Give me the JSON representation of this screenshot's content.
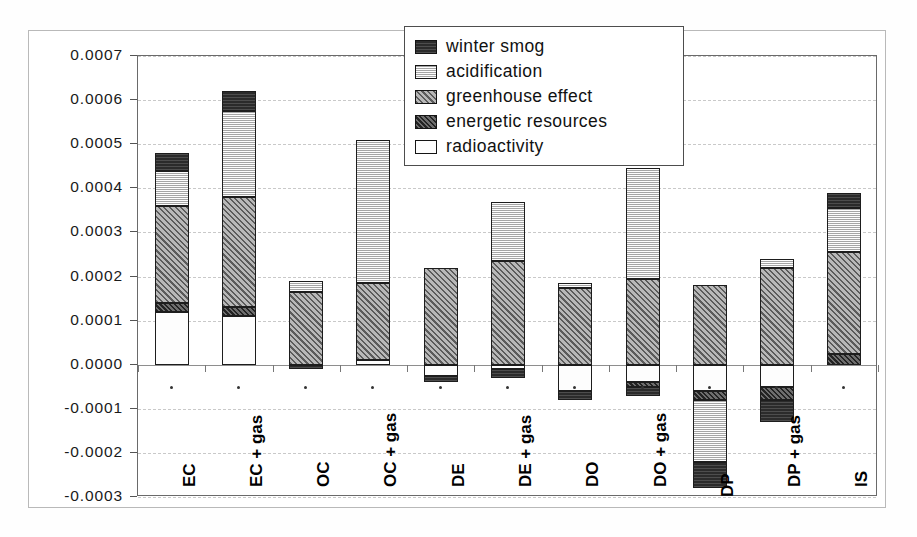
{
  "chart_data": {
    "type": "bar",
    "stacked": true,
    "title": "",
    "xlabel": "",
    "ylabel": "",
    "ylim": [
      -0.0003,
      0.0007
    ],
    "ytick_step": 0.0001,
    "ytick_labels": [
      "0.0007",
      "0.0006",
      "0.0005",
      "0.0004",
      "0.0003",
      "0.0002",
      "0.0001",
      "0.0000",
      "-0.0001",
      "-0.0002",
      "-0.0003"
    ],
    "ytick_values": [
      0.0007,
      0.0006,
      0.0005,
      0.0004,
      0.0003,
      0.0002,
      0.0001,
      0.0,
      -0.0001,
      -0.0002,
      -0.0003
    ],
    "grid": true,
    "legend_position": "top-center-inside",
    "categories": [
      "EC",
      "EC + gas",
      "OC",
      "OC + gas",
      "DE",
      "DE + gas",
      "DO",
      "DO + gas",
      "DP",
      "DP + gas",
      "IS"
    ],
    "series": [
      {
        "name": "winter smog",
        "color": "#2b2b2b",
        "pattern": "dark-solid",
        "values": [
          4e-05,
          4e-05,
          -1e-05,
          0.0,
          -2.5e-05,
          -2e-05,
          -2e-05,
          -1e-05,
          -6e-05,
          -5e-05,
          3e-05
        ]
      },
      {
        "name": "acidification",
        "color": "#dcdcdc",
        "pattern": "light-hatch",
        "values": [
          8e-05,
          0.00024,
          2e-05,
          0.000325,
          0.0,
          0.00013,
          1e-05,
          0.00025,
          -0.00014,
          2e-05,
          0.00011
        ]
      },
      {
        "name": "greenhouse effect",
        "color": "#9a9a9a",
        "pattern": "mid-diagonal",
        "values": [
          0.00022,
          0.00026,
          0.00017,
          0.00018,
          0.00022,
          0.00024,
          0.000175,
          0.000195,
          0.00018,
          0.00022,
          0.00022
        ]
      },
      {
        "name": "energetic resources",
        "color": "#4f4f4f",
        "pattern": "dark-diagonal",
        "values": [
          2e-05,
          2e-05,
          0.0,
          0.0,
          -1e-05,
          -1e-05,
          -2e-05,
          -2e-05,
          -2e-05,
          -3e-05,
          3e-05
        ]
      },
      {
        "name": "radioactivity",
        "color": "#fdfdfd",
        "pattern": "dotted",
        "values": [
          0.00012,
          0.00011,
          0.0,
          1e-05,
          -3e-05,
          -1e-05,
          -6e-05,
          -4e-05,
          -6e-05,
          -5e-05,
          0.0
        ]
      }
    ],
    "bars": [
      {
        "category": "EC",
        "positive_total": 0.00048,
        "negative_total": 0.0,
        "segments": [
          {
            "series": "radioactivity",
            "from": 0.0,
            "to": 0.00012
          },
          {
            "series": "energetic resources",
            "from": 0.00012,
            "to": 0.00014
          },
          {
            "series": "greenhouse effect",
            "from": 0.00014,
            "to": 0.00036
          },
          {
            "series": "acidification",
            "from": 0.00036,
            "to": 0.00044
          },
          {
            "series": "winter smog",
            "from": 0.00044,
            "to": 0.00048
          }
        ]
      },
      {
        "category": "EC + gas",
        "positive_total": 0.00062,
        "negative_total": 0.0,
        "segments": [
          {
            "series": "radioactivity",
            "from": 0.0,
            "to": 0.00011
          },
          {
            "series": "energetic resources",
            "from": 0.00011,
            "to": 0.00013
          },
          {
            "series": "greenhouse effect",
            "from": 0.00013,
            "to": 0.00038
          },
          {
            "series": "acidification",
            "from": 0.00038,
            "to": 0.000575
          },
          {
            "series": "winter smog",
            "from": 0.000575,
            "to": 0.00062
          }
        ]
      },
      {
        "category": "OC",
        "positive_total": 0.00019,
        "negative_total": -1e-05,
        "segments": [
          {
            "series": "winter smog",
            "from": 0.0,
            "to": -1e-05
          },
          {
            "series": "greenhouse effect",
            "from": 0.0,
            "to": 0.000165
          },
          {
            "series": "acidification",
            "from": 0.000165,
            "to": 0.00019
          }
        ]
      },
      {
        "category": "OC + gas",
        "positive_total": 0.00051,
        "negative_total": 0.0,
        "segments": [
          {
            "series": "radioactivity",
            "from": 0.0,
            "to": 1e-05
          },
          {
            "series": "greenhouse effect",
            "from": 1e-05,
            "to": 0.000185
          },
          {
            "series": "acidification",
            "from": 0.000185,
            "to": 0.00051
          }
        ]
      },
      {
        "category": "DE",
        "positive_total": 0.00022,
        "negative_total": -4e-05,
        "segments": [
          {
            "series": "winter smog",
            "from": -2.5e-05,
            "to": -4e-05
          },
          {
            "series": "radioactivity",
            "from": 0.0,
            "to": -2.5e-05
          },
          {
            "series": "greenhouse effect",
            "from": 0.0,
            "to": 0.00022
          }
        ]
      },
      {
        "category": "DE + gas",
        "positive_total": 0.00037,
        "negative_total": -3e-05,
        "segments": [
          {
            "series": "winter smog",
            "from": -1e-05,
            "to": -3e-05
          },
          {
            "series": "radioactivity",
            "from": 0.0,
            "to": -1e-05
          },
          {
            "series": "greenhouse effect",
            "from": 0.0,
            "to": 0.000235
          },
          {
            "series": "acidification",
            "from": 0.000235,
            "to": 0.00037
          }
        ]
      },
      {
        "category": "DO",
        "positive_total": 0.000185,
        "negative_total": -8e-05,
        "segments": [
          {
            "series": "winter smog",
            "from": -6e-05,
            "to": -8e-05
          },
          {
            "series": "radioactivity",
            "from": 0.0,
            "to": -6e-05
          },
          {
            "series": "greenhouse effect",
            "from": 0.0,
            "to": 0.000175
          },
          {
            "series": "acidification",
            "from": 0.000175,
            "to": 0.000185
          }
        ]
      },
      {
        "category": "DO + gas",
        "positive_total": 0.000445,
        "negative_total": -7e-05,
        "segments": [
          {
            "series": "winter smog",
            "from": -5e-05,
            "to": -7e-05
          },
          {
            "series": "radioactivity",
            "from": 0.0,
            "to": -4e-05
          },
          {
            "series": "energetic resources",
            "from": -4e-05,
            "to": -5e-05
          },
          {
            "series": "greenhouse effect",
            "from": 0.0,
            "to": 0.000195
          },
          {
            "series": "acidification",
            "from": 0.000195,
            "to": 0.000445
          }
        ]
      },
      {
        "category": "DP",
        "positive_total": 0.00018,
        "negative_total": -0.00028,
        "segments": [
          {
            "series": "greenhouse effect",
            "from": 0.0,
            "to": 0.00018
          },
          {
            "series": "radioactivity",
            "from": 0.0,
            "to": -6e-05
          },
          {
            "series": "energetic resources",
            "from": -6e-05,
            "to": -8e-05
          },
          {
            "series": "acidification",
            "from": -8e-05,
            "to": -0.00022
          },
          {
            "series": "winter smog",
            "from": -0.00022,
            "to": -0.00028
          }
        ]
      },
      {
        "category": "DP + gas",
        "positive_total": 0.00024,
        "negative_total": -0.00013,
        "segments": [
          {
            "series": "greenhouse effect",
            "from": 0.0,
            "to": 0.00022
          },
          {
            "series": "acidification",
            "from": 0.00022,
            "to": 0.00024
          },
          {
            "series": "radioactivity",
            "from": 0.0,
            "to": -5e-05
          },
          {
            "series": "energetic resources",
            "from": -5e-05,
            "to": -8e-05
          },
          {
            "series": "winter smog",
            "from": -8e-05,
            "to": -0.00013
          }
        ]
      },
      {
        "category": "IS",
        "positive_total": 0.00039,
        "negative_total": -5e-06,
        "segments": [
          {
            "series": "energetic resources",
            "from": 0.0,
            "to": 2.5e-05
          },
          {
            "series": "greenhouse effect",
            "from": 2.5e-05,
            "to": 0.000255
          },
          {
            "series": "acidification",
            "from": 0.000255,
            "to": 0.000355
          },
          {
            "series": "winter smog",
            "from": 0.000355,
            "to": 0.00039
          }
        ]
      }
    ]
  },
  "legend": {
    "items": [
      {
        "label": "winter smog",
        "swatch": "winter"
      },
      {
        "label": "acidification",
        "swatch": "acid"
      },
      {
        "label": "greenhouse effect",
        "swatch": "green"
      },
      {
        "label": "energetic resources",
        "swatch": "energy"
      },
      {
        "label": "radioactivity",
        "swatch": "radio"
      }
    ]
  }
}
